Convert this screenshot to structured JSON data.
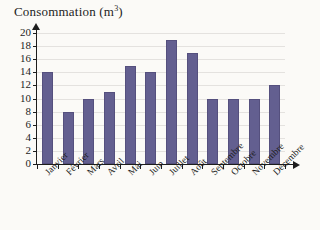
{
  "chart_data": {
    "type": "bar",
    "title": "Consommation (m3)",
    "title_main": "Consommation (m",
    "title_sup": "3",
    "title_tail": ")",
    "xlabel": "",
    "ylabel": "Consommation (m3)",
    "categories": [
      "Janvier",
      "Février",
      "Mars",
      "Avril",
      "Mai",
      "Juin",
      "Juillet",
      "Août",
      "Septembre",
      "Octobre",
      "Novembre",
      "Décembre"
    ],
    "values": [
      14,
      8,
      10,
      11,
      15,
      14,
      19,
      17,
      10,
      10,
      10,
      12
    ],
    "ylim": [
      0,
      20
    ],
    "y_ticks": [
      0,
      2,
      4,
      6,
      8,
      10,
      12,
      14,
      16,
      18,
      20
    ],
    "y_tick_labels": [
      "0",
      "2",
      "4",
      "6",
      "8",
      "10",
      "12",
      "14",
      "16",
      "18",
      "20"
    ],
    "grid": true,
    "grid_axis": "y",
    "legend": false,
    "legend_position": "none",
    "bar_color": "#635f90",
    "bar_edge_color": "#55507e",
    "grid_color": "#e4e2df",
    "axis_color": "#1d1d1d",
    "background_color": "#fbfaf7",
    "axis_arrows": true
  }
}
